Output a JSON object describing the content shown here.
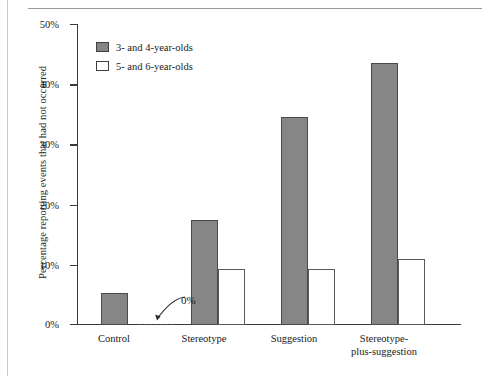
{
  "chart_data": {
    "type": "bar",
    "title": "",
    "xlabel": "",
    "ylabel": "Percentage reporting events that had not occurred",
    "categories": [
      "Control",
      "Stereotype",
      "Suggestion",
      "Stereotype-\nplus-suggestion"
    ],
    "series": [
      {
        "name": "3- and 4-year-olds",
        "values": [
          5.3,
          17.5,
          34.5,
          43.5
        ],
        "color": "#868686"
      },
      {
        "name": "5- and 6-year-olds",
        "values": [
          0,
          9.3,
          9.3,
          11.0
        ],
        "color": "#ffffff"
      }
    ],
    "ylim": [
      0,
      50
    ],
    "yticks": [
      0,
      10,
      20,
      30,
      40,
      50
    ],
    "ytick_labels": [
      "0%",
      "10%",
      "20%",
      "30%",
      "40%",
      "50%"
    ],
    "grid": false,
    "legend_position": "top-left",
    "annotations": [
      {
        "text": "0%",
        "target_category": "Control",
        "target_series": "5- and 6-year-olds",
        "value": 0
      }
    ]
  },
  "legend": {
    "items": [
      {
        "label": "3- and 4-year-olds",
        "swatch": "filled-gray-swatch"
      },
      {
        "label": "5- and 6-year-olds",
        "swatch": "empty-white-swatch"
      }
    ]
  },
  "categories": [
    {
      "line1": "Control",
      "line2": ""
    },
    {
      "line1": "Stereotype",
      "line2": ""
    },
    {
      "line1": "Suggestion",
      "line2": ""
    },
    {
      "line1": "Stereotype-",
      "line2": "plus-suggestion"
    }
  ],
  "yaxis": {
    "label": "Percentage reporting events that had not occurred",
    "ticks": [
      "50%",
      "40%",
      "30%",
      "20%",
      "10%",
      "0%"
    ]
  },
  "annotation": {
    "zero_label": "0%"
  },
  "colors": {
    "bar_gray": "#868686",
    "bar_white": "#ffffff",
    "axis": "#3a3a3a",
    "text": "#1a1a1a"
  }
}
